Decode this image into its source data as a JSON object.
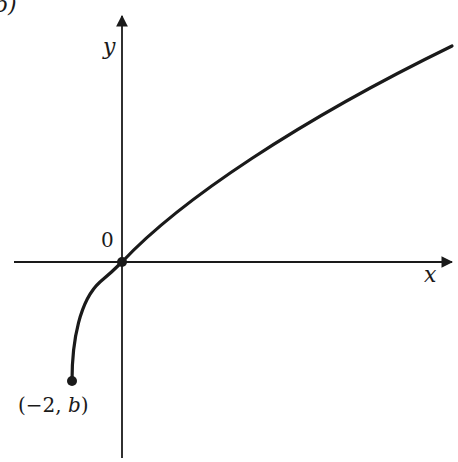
{
  "figure": {
    "part_label": "b)",
    "x_axis_label": "x",
    "y_axis_label": "y",
    "origin_label": "0",
    "endpoint_label": "(−2, b)"
  },
  "colors": {
    "ink": "#1a1a1a",
    "background": "#ffffff"
  },
  "chart_data": {
    "type": "line",
    "title": "",
    "xlabel": "x",
    "ylabel": "y",
    "series": [
      {
        "name": "curve",
        "x": [
          -2,
          -1.5,
          -1,
          0,
          2,
          4,
          6,
          8,
          10,
          12.2
        ],
        "y_shape": "sqrt(x+2) shifted so curve passes through origin; endpoint y = b (negative)"
      }
    ],
    "points": [
      {
        "label": "(−2, b)",
        "x": -2,
        "y": "b",
        "marker": "filled-dot"
      },
      {
        "label": "0",
        "x": 0,
        "y": 0,
        "marker": "filled-dot"
      }
    ],
    "grid": false,
    "legend": null
  }
}
